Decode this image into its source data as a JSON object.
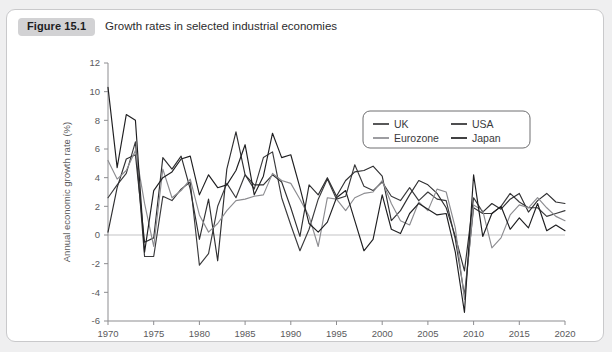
{
  "figure": {
    "number_label": "Figure 15.1",
    "caption": "Growth rates in selected industrial economies"
  },
  "chart_data": {
    "type": "line",
    "title": "Growth rates in selected industrial economies",
    "xlabel": "",
    "ylabel": "Annual economic growth rate (%)",
    "xlim": [
      1970,
      2020
    ],
    "ylim": [
      -6,
      12
    ],
    "xticks": [
      1970,
      1975,
      1980,
      1985,
      1990,
      1995,
      2000,
      2005,
      2010,
      2015,
      2020
    ],
    "yticks": [
      -6,
      -4,
      -2,
      0,
      2,
      4,
      6,
      8,
      10,
      12
    ],
    "grid": false,
    "zero_line": true,
    "legend_position": "top-right",
    "x": [
      1970,
      1971,
      1972,
      1973,
      1974,
      1975,
      1976,
      1977,
      1978,
      1979,
      1980,
      1981,
      1982,
      1983,
      1984,
      1985,
      1986,
      1987,
      1988,
      1989,
      1990,
      1991,
      1992,
      1993,
      1994,
      1995,
      1996,
      1997,
      1998,
      1999,
      2000,
      2001,
      2002,
      2003,
      2004,
      2005,
      2006,
      2007,
      2008,
      2009,
      2010,
      2011,
      2012,
      2013,
      2014,
      2015,
      2016,
      2017,
      2018,
      2019,
      2020
    ],
    "series": [
      {
        "name": "UK",
        "color": "#3a3a3c",
        "values": [
          2.6,
          3.5,
          4.3,
          6.5,
          -1.5,
          -1.5,
          2.7,
          2.4,
          3.2,
          3.7,
          -2.1,
          -1.3,
          2.0,
          3.6,
          2.6,
          4.2,
          3.2,
          5.4,
          5.8,
          2.6,
          0.7,
          -1.1,
          0.4,
          2.5,
          3.9,
          2.5,
          2.7,
          4.9,
          3.4,
          3.1,
          3.7,
          2.7,
          2.4,
          3.3,
          2.4,
          3.0,
          2.5,
          2.4,
          -0.3,
          -4.2,
          1.9,
          1.5,
          1.5,
          2.0,
          2.9,
          2.3,
          1.9,
          1.9,
          1.3,
          1.5,
          1.7
        ]
      },
      {
        "name": "USA",
        "color": "#2f2f31",
        "values": [
          0.2,
          3.3,
          5.3,
          5.6,
          -0.5,
          -0.2,
          5.4,
          4.6,
          5.5,
          3.2,
          -0.3,
          2.5,
          -1.8,
          4.6,
          7.2,
          4.2,
          3.5,
          3.5,
          4.2,
          3.7,
          1.9,
          -0.1,
          3.5,
          2.8,
          4.0,
          2.7,
          3.8,
          4.4,
          4.5,
          4.8,
          4.1,
          1.0,
          1.7,
          2.8,
          3.8,
          3.5,
          2.9,
          1.9,
          -0.1,
          -2.5,
          2.6,
          1.6,
          2.2,
          1.8,
          2.5,
          2.9,
          1.6,
          2.4,
          2.9,
          2.3,
          2.2
        ]
      },
      {
        "name": "Eurozone",
        "color": "#8c8c90",
        "values": [
          5.2,
          3.9,
          4.5,
          5.9,
          2.2,
          -0.8,
          4.6,
          2.6,
          3.1,
          3.9,
          1.4,
          0.2,
          0.8,
          1.7,
          2.4,
          2.5,
          2.7,
          2.8,
          4.3,
          3.8,
          3.6,
          2.5,
          1.3,
          -0.8,
          2.6,
          2.5,
          1.7,
          2.6,
          2.9,
          3.0,
          3.8,
          2.2,
          1.0,
          0.7,
          2.3,
          1.7,
          3.2,
          3.0,
          0.5,
          -4.5,
          2.1,
          1.7,
          -0.9,
          -0.2,
          1.4,
          2.1,
          1.9,
          2.6,
          1.9,
          1.3,
          1.0
        ]
      },
      {
        "name": "Japan",
        "color": "#1f1f21",
        "values": [
          10.3,
          4.7,
          8.4,
          8.0,
          -1.2,
          3.1,
          4.0,
          4.4,
          5.3,
          5.5,
          2.8,
          4.2,
          3.3,
          3.5,
          4.5,
          6.3,
          2.8,
          4.1,
          7.1,
          5.4,
          5.6,
          3.3,
          0.8,
          0.2,
          0.9,
          2.6,
          3.1,
          1.0,
          -1.1,
          -0.3,
          2.8,
          0.4,
          0.1,
          1.5,
          2.2,
          1.8,
          1.4,
          1.5,
          -1.2,
          -5.4,
          4.2,
          -0.1,
          1.5,
          2.0,
          0.4,
          1.2,
          0.5,
          2.2,
          0.3,
          0.7,
          0.3
        ]
      }
    ]
  },
  "legend": {
    "entries": [
      {
        "label": "UK",
        "color": "#3a3a3c"
      },
      {
        "label": "USA",
        "color": "#2f2f31"
      },
      {
        "label": "Eurozone",
        "color": "#8c8c90"
      },
      {
        "label": "Japan",
        "color": "#1f1f21"
      }
    ]
  }
}
